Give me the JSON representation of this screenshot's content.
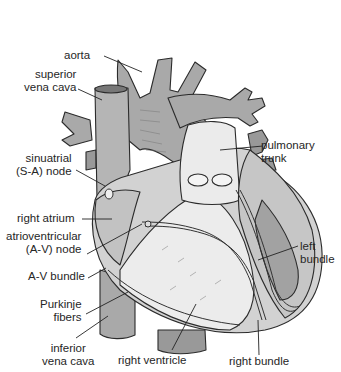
{
  "figure": {
    "colors": {
      "vessel": "#a9a9a9",
      "chamber": "#cfcfcf",
      "light": "#ebebeb",
      "outline": "#2b2b2b",
      "leader": "#222222"
    }
  },
  "labels": {
    "aorta": "aorta",
    "superior_vena_cava": [
      "superior",
      "vena cava"
    ],
    "sinuatrial_node": [
      "sinuatrial",
      "(S-A) node"
    ],
    "right_atrium": "right atrium",
    "av_node": [
      "atrioventricular",
      "(A-V) node"
    ],
    "av_bundle": "A-V bundle",
    "purkinje_fibers": [
      "Purkinje",
      "fibers"
    ],
    "inferior_vena_cava": [
      "inferior",
      "vena cava"
    ],
    "right_ventricle": "right ventricle",
    "right_bundle": "right bundle",
    "left_bundle": [
      "left",
      "bundle"
    ],
    "pulmonary_trunk": [
      "pulmonary",
      "trunk"
    ]
  }
}
